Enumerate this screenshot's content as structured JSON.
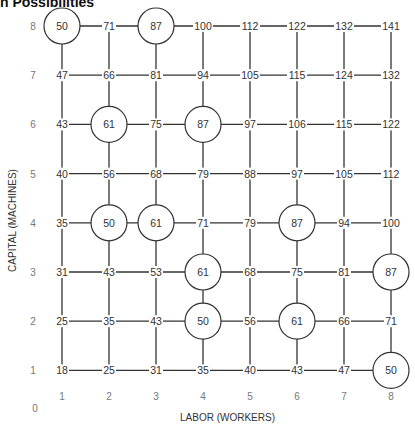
{
  "title": "n Possibilities",
  "axes": {
    "x_label": "LABOR (WORKERS)",
    "y_label": "CAPITAL (MACHINES)",
    "x_ticks": [
      "1",
      "2",
      "3",
      "4",
      "5",
      "6",
      "7",
      "8"
    ],
    "y_ticks": [
      "1",
      "2",
      "3",
      "4",
      "5",
      "6",
      "7",
      "8"
    ],
    "origin": "0"
  },
  "grid": {
    "rows": [
      {
        "capital": 8,
        "values": [
          50,
          71,
          87,
          100,
          112,
          122,
          132,
          141
        ]
      },
      {
        "capital": 7,
        "values": [
          47,
          66,
          81,
          94,
          105,
          115,
          124,
          132
        ]
      },
      {
        "capital": 6,
        "values": [
          43,
          61,
          75,
          87,
          97,
          106,
          115,
          122
        ]
      },
      {
        "capital": 5,
        "values": [
          40,
          56,
          68,
          79,
          88,
          97,
          105,
          112
        ]
      },
      {
        "capital": 4,
        "values": [
          35,
          50,
          61,
          71,
          79,
          87,
          94,
          100
        ]
      },
      {
        "capital": 3,
        "values": [
          31,
          43,
          53,
          61,
          68,
          75,
          81,
          87
        ]
      },
      {
        "capital": 2,
        "values": [
          25,
          35,
          43,
          50,
          56,
          61,
          66,
          71
        ]
      },
      {
        "capital": 1,
        "values": [
          18,
          25,
          31,
          35,
          40,
          43,
          47,
          50
        ]
      }
    ],
    "circled": [
      {
        "labor": 1,
        "capital": 8,
        "value": 50
      },
      {
        "labor": 3,
        "capital": 8,
        "value": 87
      },
      {
        "labor": 2,
        "capital": 6,
        "value": 61
      },
      {
        "labor": 4,
        "capital": 6,
        "value": 87
      },
      {
        "labor": 2,
        "capital": 4,
        "value": 50
      },
      {
        "labor": 3,
        "capital": 4,
        "value": 61
      },
      {
        "labor": 6,
        "capital": 4,
        "value": 87
      },
      {
        "labor": 4,
        "capital": 3,
        "value": 61
      },
      {
        "labor": 8,
        "capital": 3,
        "value": 87
      },
      {
        "labor": 4,
        "capital": 2,
        "value": 50
      },
      {
        "labor": 6,
        "capital": 2,
        "value": 61
      },
      {
        "labor": 8,
        "capital": 1,
        "value": 50
      }
    ]
  },
  "colors": {
    "line": "#333333",
    "text": "#333333",
    "tick": "#777777",
    "bg": "#ffffff"
  }
}
